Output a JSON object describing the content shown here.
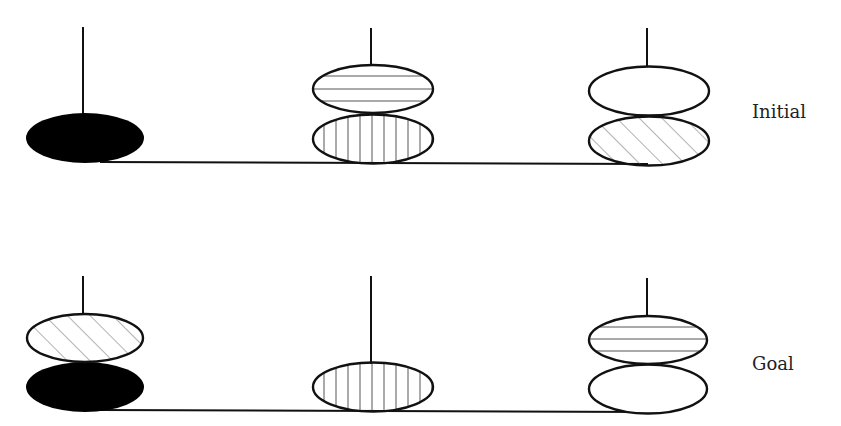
{
  "colors": {
    "stroke": "#111111",
    "hatch": "#555555",
    "solid_fill": "#000000",
    "background": "#ffffff"
  },
  "states": [
    {
      "label": "Initial",
      "pegs": [
        {
          "position": "left",
          "disks_bottom_to_top": [
            "solid-black"
          ]
        },
        {
          "position": "middle",
          "disks_bottom_to_top": [
            "vertical-stripes",
            "horizontal-stripes"
          ]
        },
        {
          "position": "right",
          "disks_bottom_to_top": [
            "diagonal-stripes",
            "plain-white"
          ]
        }
      ]
    },
    {
      "label": "Goal",
      "pegs": [
        {
          "position": "left",
          "disks_bottom_to_top": [
            "solid-black",
            "diagonal-stripes"
          ]
        },
        {
          "position": "middle",
          "disks_bottom_to_top": [
            "vertical-stripes"
          ]
        },
        {
          "position": "right",
          "disks_bottom_to_top": [
            "plain-white",
            "horizontal-stripes"
          ]
        }
      ]
    }
  ]
}
